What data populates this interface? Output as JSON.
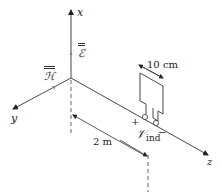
{
  "diagram": {
    "type": "3d-coordinate-setup",
    "axes": {
      "x": {
        "label": "x"
      },
      "y": {
        "label": "y"
      },
      "z": {
        "label": "z"
      }
    },
    "fields": {
      "electric": {
        "label": "ℰ",
        "along": "x"
      },
      "magnetic": {
        "label": "ℋ",
        "along": "y"
      }
    },
    "loop": {
      "width_label": "10 cm",
      "plus_label": "+",
      "minus_label": "−",
      "voltage_symbol": "𝒱",
      "voltage_subscript": "ind"
    },
    "distance": {
      "label": "2 m"
    },
    "colors": {
      "line": "#333333",
      "dashed": "#666666",
      "background": "#ffffff"
    }
  }
}
